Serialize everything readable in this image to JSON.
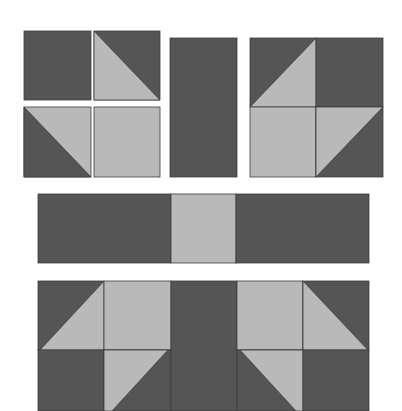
{
  "diagram": {
    "colors": {
      "background": "#ffffff",
      "dark": "#555555",
      "light": "#b9b9b9",
      "seam": "#3c3c3c"
    },
    "units": [
      {
        "name": "four-patch-unit",
        "description": "2x2 unit: dark square, half-square triangle, half-square triangle, light square"
      },
      {
        "name": "dark-rectangle-unit",
        "description": "tall dark rectangle"
      },
      {
        "name": "corner-block-unit",
        "description": "2x2 block with half-square triangles forming light corner shape"
      },
      {
        "name": "center-strip",
        "description": "dark rectangle, light square, dark rectangle"
      },
      {
        "name": "assembled-row",
        "description": "mirrored blocks joined by dark center rectangle"
      }
    ]
  }
}
